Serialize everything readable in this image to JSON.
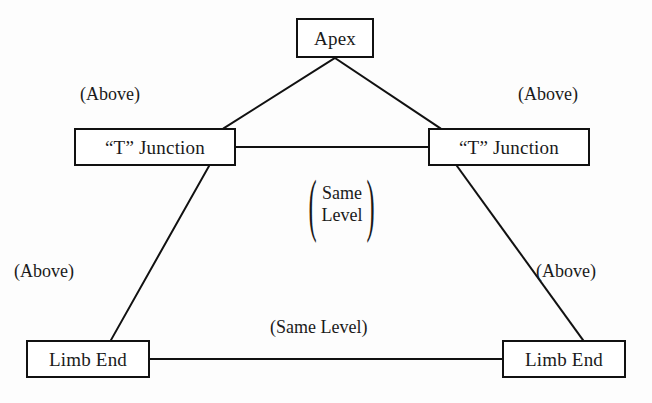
{
  "figure": {
    "line_color": "#111111",
    "text_color": "#1a1a1a",
    "background_color": "#fdfdfd"
  },
  "nodes": [
    {
      "id": "apex",
      "label": "Apex",
      "x": 296,
      "y": 18,
      "width": 78,
      "height": 40
    },
    {
      "id": "t-junction-left",
      "label": "“T” Junction",
      "x": 74,
      "y": 128,
      "width": 162,
      "height": 38
    },
    {
      "id": "t-junction-right",
      "label": "“T” Junction",
      "x": 428,
      "y": 128,
      "width": 162,
      "height": 38
    },
    {
      "id": "limb-end-left",
      "label": "Limb End",
      "x": 26,
      "y": 340,
      "width": 124,
      "height": 38
    },
    {
      "id": "limb-end-right",
      "label": "Limb End",
      "x": 502,
      "y": 340,
      "width": 124,
      "height": 38
    }
  ],
  "edges": [
    {
      "id": "apex-to-left-t",
      "from": "apex",
      "to": "t-junction-left",
      "x1": 335,
      "y1": 58,
      "x2": 224,
      "y2": 128,
      "relation": "(Above)"
    },
    {
      "id": "apex-to-right-t",
      "from": "apex",
      "to": "t-junction-right",
      "x1": 335,
      "y1": 58,
      "x2": 440,
      "y2": 128,
      "relation": "(Above)"
    },
    {
      "id": "left-t-to-right-t",
      "from": "t-junction-left",
      "to": "t-junction-right",
      "x1": 236,
      "y1": 147,
      "x2": 428,
      "y2": 147,
      "relation": "(Same Level)"
    },
    {
      "id": "left-t-to-limb-end",
      "from": "t-junction-left",
      "to": "limb-end-left",
      "x1": 209,
      "y1": 166,
      "x2": 111,
      "y2": 340,
      "relation": "(Above)"
    },
    {
      "id": "right-t-to-limb-end",
      "from": "t-junction-right",
      "to": "limb-end-right",
      "x1": 457,
      "y1": 166,
      "x2": 583,
      "y2": 340,
      "relation": "(Above)"
    },
    {
      "id": "limb-end-to-limb-end",
      "from": "limb-end-left",
      "to": "limb-end-right",
      "x1": 150,
      "y1": 359,
      "x2": 502,
      "y2": 359,
      "relation": "(Same Level)"
    }
  ],
  "labels": {
    "above_top_left": "(Above)",
    "above_top_right": "(Above)",
    "above_bottom_left": "(Above)",
    "above_bottom_right": "(Above)",
    "same_level_center_line1": "Same",
    "same_level_center_line2": "Level",
    "same_level_bottom": "(Same Level)",
    "paren_open": "(",
    "paren_close": ")"
  }
}
